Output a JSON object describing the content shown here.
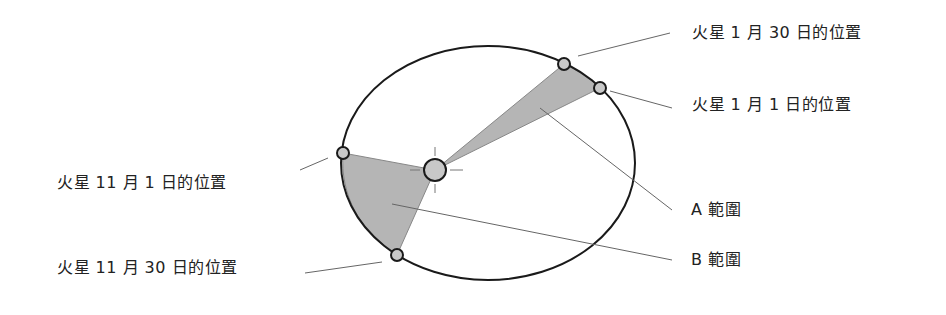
{
  "diagram": {
    "labels": {
      "mars_jan30": "火星 1 月 30 日的位置",
      "mars_jan1": "火星 1 月 1 日的位置",
      "mars_nov1": "火星 11 月 1 日的位置",
      "mars_nov30": "火星 11 月 30 日的位置",
      "area_a": "A 範圍",
      "area_b": "B 範圍"
    },
    "colors": {
      "orbit": "#1a1a1a",
      "area_fill": "#b5b5b5",
      "leader": "#666666",
      "planet_fill": "#c8c8c8"
    }
  }
}
